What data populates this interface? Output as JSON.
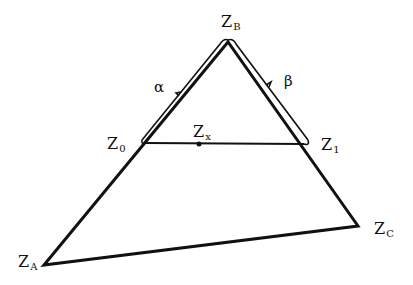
{
  "diagram": {
    "type": "triangle-with-interpolation",
    "stroke_color": "#111111",
    "background": "#ffffff",
    "points": {
      "ZA": {
        "x": 44,
        "y": 265
      },
      "ZB": {
        "x": 228,
        "y": 42
      },
      "ZC": {
        "x": 358,
        "y": 226
      },
      "Z0": {
        "x": 146,
        "y": 143
      },
      "Z1": {
        "x": 304,
        "y": 144
      },
      "Zx": {
        "x": 199,
        "y": 144
      }
    },
    "labels": {
      "ZA": {
        "base": "Z",
        "sub": "A"
      },
      "ZB": {
        "base": "Z",
        "sub": "B"
      },
      "ZC": {
        "base": "Z",
        "sub": "C"
      },
      "Z0": {
        "base": "Z",
        "sub": "0"
      },
      "Z1": {
        "base": "Z",
        "sub": "1"
      },
      "Zx": {
        "base": "Z",
        "sub": "x"
      },
      "alpha": "α",
      "beta": "β"
    }
  }
}
